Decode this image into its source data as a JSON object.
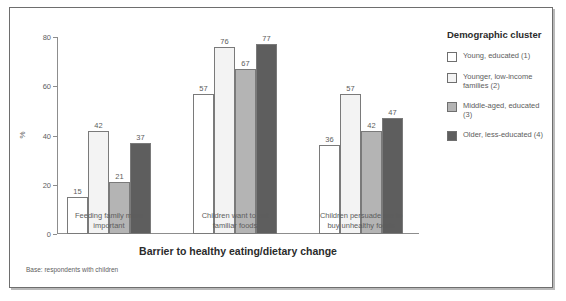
{
  "legend": {
    "title": "Demographic cluster",
    "items": [
      {
        "label": "Young, educated (1)",
        "color": "#ffffff"
      },
      {
        "label": "Younger, low-income families (2)",
        "color": "#f3f3f3"
      },
      {
        "label": "Middle-aged, educated (3)",
        "color": "#b4b4b4"
      },
      {
        "label": "Older, less-educated (4)",
        "color": "#5e5e5e"
      }
    ]
  },
  "axis": {
    "ylabel": "%",
    "yticks": [
      "0",
      "20",
      "40",
      "60",
      "80"
    ],
    "xtitle": "Barrier to healthy eating/dietary change"
  },
  "note": "Base: respondents with children",
  "chart_data": {
    "type": "bar",
    "title": "",
    "xlabel": "Barrier to healthy eating/dietary change",
    "ylabel": "%",
    "ylim": [
      0,
      80
    ],
    "grid": false,
    "legend_position": "right",
    "categories": [
      "Feeding family more important",
      "Children want to eat familiar foods",
      "Children persuade me to buy unhealthy foods"
    ],
    "category_lines": [
      [
        "Feeding family more",
        "important"
      ],
      [
        "Children want to eat",
        "familiar foods"
      ],
      [
        "Children persuade me to",
        "buy unhealthy foods"
      ]
    ],
    "series": [
      {
        "name": "Young, educated (1)",
        "color": "#ffffff",
        "values": [
          15,
          57,
          36
        ]
      },
      {
        "name": "Younger, low-income families (2)",
        "color": "#f3f3f3",
        "values": [
          42,
          76,
          57
        ]
      },
      {
        "name": "Middle-aged, educated (3)",
        "color": "#b4b4b4",
        "values": [
          21,
          67,
          42
        ]
      },
      {
        "name": "Older, less-educated (4)",
        "color": "#5e5e5e",
        "values": [
          37,
          77,
          47
        ]
      }
    ]
  }
}
